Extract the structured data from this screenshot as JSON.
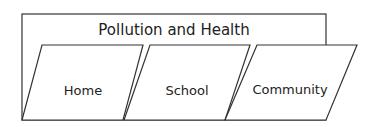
{
  "diagram": {
    "title": "Pollution and Health",
    "items": [
      {
        "label": "Home"
      },
      {
        "label": "School"
      },
      {
        "label": "Community"
      }
    ],
    "stroke_color": "#333333",
    "background": "#ffffff"
  }
}
